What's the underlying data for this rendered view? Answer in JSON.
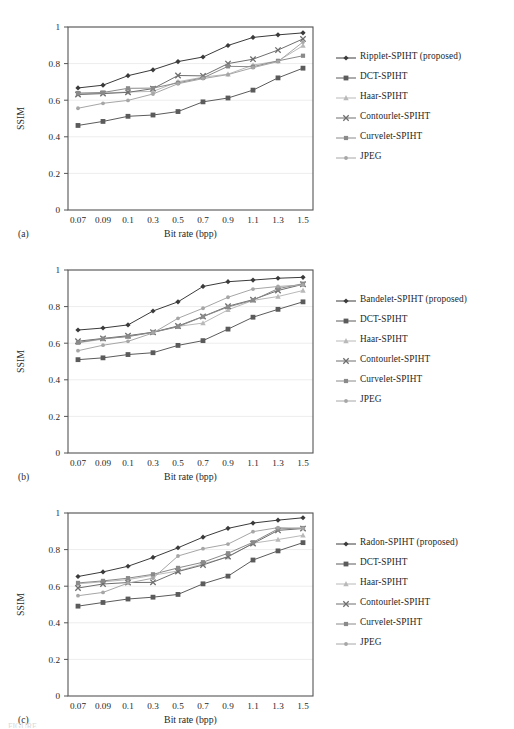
{
  "figure": {
    "panels": [
      "(a)",
      "(b)",
      "(c)"
    ],
    "caption_fragment": "FIGURE"
  },
  "axis": {
    "xlabel": "Bit rate (bpp)",
    "ylabel": "SSIM",
    "xticks": [
      "0.07",
      "0.09",
      "0.1",
      "0.3",
      "0.5",
      "0.7",
      "0.9",
      "1.1",
      "1.3",
      "1.5"
    ],
    "yticks": [
      "0",
      "0.2",
      "0.4",
      "0.6",
      "0.8",
      "1"
    ],
    "ylim": [
      0,
      1
    ],
    "grid": "horizontal"
  },
  "colors": {
    "proposed": "#3b3b3b",
    "dct": "#5b5b5b",
    "haar": "#b9b9b9",
    "contourlet": "#6e6e6e",
    "curvelet": "#8a8a8a",
    "jpeg": "#a6a6a6",
    "axis": "#555555",
    "grid": "#ededed",
    "text": "#1f1f1f"
  },
  "chart_data": [
    {
      "id": "a",
      "panel_label": "(a)",
      "type": "line",
      "title": "",
      "xlabel": "Bit rate (bpp)",
      "ylabel": "SSIM",
      "ylim": [
        0,
        1
      ],
      "grid": true,
      "legend_position": "right",
      "categories": [
        "0.07",
        "0.09",
        "0.1",
        "0.3",
        "0.5",
        "0.7",
        "0.9",
        "1.1",
        "1.3",
        "1.5"
      ],
      "series": [
        {
          "name": "Ripplet-SPIHT (proposed)",
          "marker": "diamond",
          "color": "#3b3b3b",
          "values": [
            0.667,
            0.682,
            0.734,
            0.766,
            0.811,
            0.836,
            0.899,
            0.943,
            0.957,
            0.968
          ]
        },
        {
          "name": "DCT-SPIHT",
          "marker": "square",
          "color": "#5b5b5b",
          "values": [
            0.462,
            0.484,
            0.512,
            0.519,
            0.538,
            0.591,
            0.612,
            0.655,
            0.722,
            0.775
          ]
        },
        {
          "name": "Haar-SPIHT",
          "marker": "triangle",
          "color": "#b9b9b9",
          "values": [
            0.634,
            0.639,
            0.645,
            0.648,
            0.701,
            0.726,
            0.742,
            0.792,
            0.814,
            0.898
          ]
        },
        {
          "name": "Contourlet-SPIHT",
          "marker": "cross",
          "color": "#6e6e6e",
          "values": [
            0.631,
            0.636,
            0.643,
            0.663,
            0.735,
            0.733,
            0.8,
            0.824,
            0.874,
            0.935
          ]
        },
        {
          "name": "Curvelet-SPIHT",
          "marker": "square-sm",
          "color": "#8a8a8a",
          "values": [
            0.639,
            0.642,
            0.665,
            0.666,
            0.695,
            0.722,
            0.785,
            0.783,
            0.815,
            0.843
          ]
        },
        {
          "name": "JPEG",
          "marker": "dot",
          "color": "#a6a6a6",
          "values": [
            0.556,
            0.583,
            0.599,
            0.634,
            0.69,
            0.718,
            0.74,
            0.778,
            0.811,
            0.918
          ]
        }
      ]
    },
    {
      "id": "b",
      "panel_label": "(b)",
      "type": "line",
      "title": "",
      "xlabel": "Bit rate (bpp)",
      "ylabel": "SSIM",
      "ylim": [
        0,
        1
      ],
      "grid": true,
      "legend_position": "right",
      "categories": [
        "0.07",
        "0.09",
        "0.1",
        "0.3",
        "0.5",
        "0.7",
        "0.9",
        "1.1",
        "1.3",
        "1.5"
      ],
      "series": [
        {
          "name": "Bandelet-SPIHT (proposed)",
          "marker": "diamond",
          "color": "#3b3b3b",
          "values": [
            0.672,
            0.683,
            0.7,
            0.776,
            0.826,
            0.91,
            0.936,
            0.945,
            0.955,
            0.96
          ]
        },
        {
          "name": "DCT-SPIHT",
          "marker": "square",
          "color": "#5b5b5b",
          "values": [
            0.51,
            0.52,
            0.538,
            0.548,
            0.588,
            0.614,
            0.677,
            0.742,
            0.785,
            0.826
          ]
        },
        {
          "name": "Haar-SPIHT",
          "marker": "triangle",
          "color": "#b9b9b9",
          "values": [
            0.602,
            0.622,
            0.638,
            0.66,
            0.692,
            0.71,
            0.782,
            0.834,
            0.855,
            0.888
          ]
        },
        {
          "name": "Contourlet-SPIHT",
          "marker": "cross",
          "color": "#6e6e6e",
          "values": [
            0.611,
            0.626,
            0.641,
            0.66,
            0.694,
            0.746,
            0.802,
            0.838,
            0.888,
            0.922
          ]
        },
        {
          "name": "Curvelet-SPIHT",
          "marker": "square-sm",
          "color": "#8a8a8a",
          "values": [
            0.604,
            0.625,
            0.636,
            0.659,
            0.69,
            0.745,
            0.798,
            0.835,
            0.898,
            0.925
          ]
        },
        {
          "name": "JPEG",
          "marker": "dot",
          "color": "#a6a6a6",
          "values": [
            0.559,
            0.589,
            0.61,
            0.656,
            0.736,
            0.791,
            0.851,
            0.896,
            0.91,
            0.918
          ]
        }
      ]
    },
    {
      "id": "c",
      "panel_label": "(c)",
      "type": "line",
      "title": "",
      "xlabel": "Bit rate (bpp)",
      "ylabel": "SSIM",
      "ylim": [
        0,
        1
      ],
      "grid": true,
      "legend_position": "right",
      "categories": [
        "0.07",
        "0.09",
        "0.1",
        "0.3",
        "0.5",
        "0.7",
        "0.9",
        "1.1",
        "1.3",
        "1.5"
      ],
      "series": [
        {
          "name": "Radon-SPIHT (proposed)",
          "marker": "diamond",
          "color": "#3b3b3b",
          "values": [
            0.653,
            0.678,
            0.709,
            0.757,
            0.81,
            0.868,
            0.916,
            0.945,
            0.961,
            0.974
          ]
        },
        {
          "name": "DCT-SPIHT",
          "marker": "square",
          "color": "#5b5b5b",
          "values": [
            0.491,
            0.511,
            0.53,
            0.54,
            0.555,
            0.613,
            0.655,
            0.743,
            0.793,
            0.838
          ]
        },
        {
          "name": "Haar-SPIHT",
          "marker": "triangle",
          "color": "#b9b9b9",
          "values": [
            0.613,
            0.624,
            0.636,
            0.66,
            0.683,
            0.722,
            0.759,
            0.835,
            0.855,
            0.878
          ]
        },
        {
          "name": "Contourlet-SPIHT",
          "marker": "cross",
          "color": "#6e6e6e",
          "values": [
            0.59,
            0.612,
            0.62,
            0.621,
            0.68,
            0.716,
            0.762,
            0.833,
            0.905,
            0.915
          ]
        },
        {
          "name": "Curvelet-SPIHT",
          "marker": "square-sm",
          "color": "#8a8a8a",
          "values": [
            0.618,
            0.629,
            0.644,
            0.665,
            0.7,
            0.731,
            0.78,
            0.84,
            0.913,
            0.918
          ]
        },
        {
          "name": "JPEG",
          "marker": "dot",
          "color": "#a6a6a6",
          "values": [
            0.548,
            0.566,
            0.617,
            0.644,
            0.765,
            0.805,
            0.83,
            0.898,
            0.92,
            0.916
          ]
        }
      ]
    }
  ]
}
